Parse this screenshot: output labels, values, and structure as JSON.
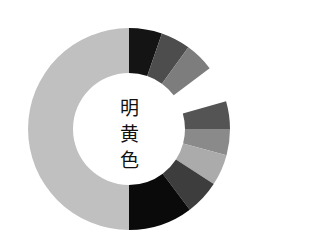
{
  "chart_data": {
    "type": "pie",
    "variant": "donut",
    "center_label": [
      "明",
      "黄",
      "色"
    ],
    "center": [
      129,
      129
    ],
    "outer_radius": 101,
    "inner_radius": 56,
    "segments": [
      {
        "start": 0,
        "end": 19,
        "color": "#141414"
      },
      {
        "start": 19,
        "end": 36,
        "color": "#4d4d4d"
      },
      {
        "start": 36,
        "end": 53,
        "color": "#7d7d7d"
      },
      {
        "start": 74,
        "end": 90,
        "color": "#545454"
      },
      {
        "start": 90,
        "end": 105,
        "color": "#8a8a8a"
      },
      {
        "start": 105,
        "end": 123,
        "color": "#ababab"
      },
      {
        "start": 123,
        "end": 143,
        "color": "#3d3d3d"
      },
      {
        "start": 143,
        "end": 180,
        "color": "#0a0a0a"
      },
      {
        "start": 180,
        "end": 360,
        "color": "#c0c0c0"
      }
    ],
    "gap": {
      "start": 53,
      "end": 74
    },
    "legend": false,
    "grid": false
  }
}
